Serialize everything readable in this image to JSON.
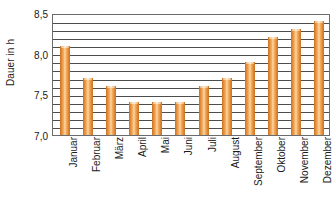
{
  "chart_data": {
    "type": "bar",
    "title": "",
    "xlabel": "",
    "ylabel": "Dauer in h",
    "categories": [
      "Januar",
      "Februar",
      "März",
      "April",
      "Mai",
      "Juni",
      "Juli",
      "August",
      "September",
      "Oktober",
      "November",
      "Dezember"
    ],
    "values": [
      8.1,
      7.7,
      7.6,
      7.4,
      7.4,
      7.4,
      7.6,
      7.7,
      7.9,
      8.2,
      8.3,
      8.4
    ],
    "ylim": [
      7.0,
      8.5
    ],
    "y_major_ticks": [
      "7,0",
      "7,5",
      "8,0",
      "8,5"
    ],
    "y_major_tick_values": [
      7.0,
      7.5,
      8.0,
      8.5
    ],
    "y_minor_tick_step": 0.1,
    "grid": true,
    "legend": false,
    "legend_position": "none",
    "bar_color": "#eb9a41",
    "bar_edge_color": "#cf7a2b",
    "grid_color": "#4d4d4d",
    "axis_color": "#6b6b6b",
    "background_color": "#ffffff",
    "text_color": "#1a1a1a"
  }
}
